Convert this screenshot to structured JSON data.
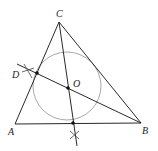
{
  "diagram": {
    "type": "triangle-incircle-construction",
    "labels": {
      "A": "A",
      "B": "B",
      "C": "C",
      "D": "D",
      "O": "O"
    },
    "colors": {
      "line": "#2a2a2a",
      "circle": "#a8a8a8",
      "point": "#111111"
    },
    "points": {
      "A": [
        15,
        124
      ],
      "B": [
        141,
        123
      ],
      "C": [
        59,
        22
      ],
      "D": [
        37,
        73
      ],
      "O": [
        68,
        88
      ],
      "E": [
        73,
        123
      ]
    }
  }
}
